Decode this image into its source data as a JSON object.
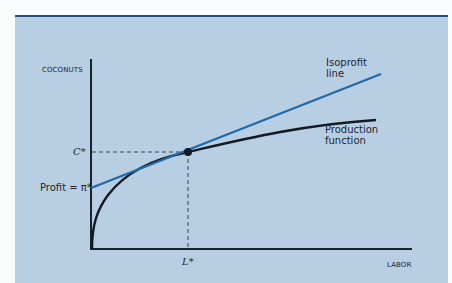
{
  "diagram": {
    "axes": {
      "y_label": "COCONUTS",
      "x_label": "LABOR"
    },
    "curves": {
      "isoprofit": {
        "label_line1": "Isoprofit",
        "label_line2": "line",
        "color": "#1f6aa8"
      },
      "production": {
        "label_line1": "Production",
        "label_line2": "function",
        "color": "#141a24"
      }
    },
    "markers": {
      "c_star": "C*",
      "l_star": "L*",
      "profit_intercept": "Profit = π*"
    },
    "colors": {
      "panel_bg": "#b8cfe3",
      "top_border": "#2b5078",
      "axis": "#1a2230"
    }
  }
}
